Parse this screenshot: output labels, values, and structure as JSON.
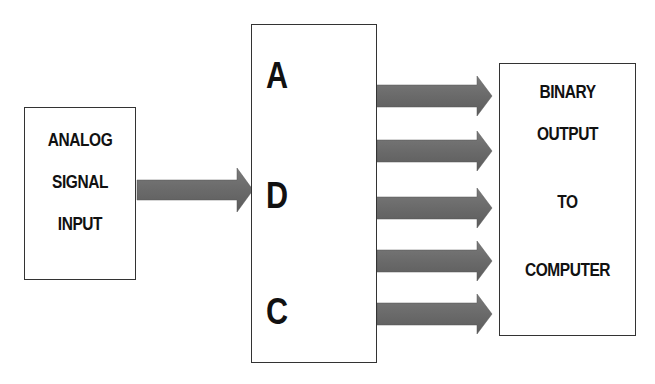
{
  "diagram": {
    "input_box": {
      "lines": [
        "ANALOG",
        "SIGNAL",
        "INPUT"
      ]
    },
    "adc_box": {
      "letters": [
        "A",
        "D",
        "C"
      ]
    },
    "output_box": {
      "lines": [
        "BINARY",
        "OUTPUT",
        "TO",
        "COMPUTER"
      ]
    },
    "arrows": {
      "input_count": 1,
      "output_count": 5,
      "color": "#666666"
    },
    "colors": {
      "border": "#333333",
      "text": "#111111",
      "background": "#ffffff"
    }
  }
}
